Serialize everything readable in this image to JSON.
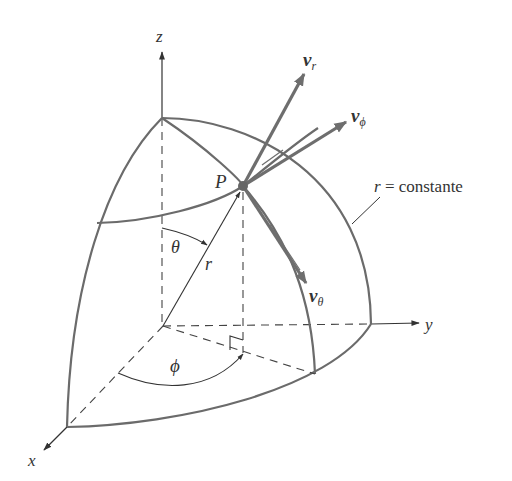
{
  "figure": {
    "colors": {
      "surface": "#6b6b6b",
      "vector": "#6e6e6e",
      "axis": "#333333",
      "text": "#333333",
      "background": "#ffffff"
    },
    "labels": {
      "z_axis": "z",
      "y_axis": "y",
      "x_axis": "x",
      "point": "P",
      "radius": "r",
      "theta": "θ",
      "phi": "ϕ",
      "v_r_main": "v",
      "v_r_sub": "r",
      "v_phi_main": "v",
      "v_phi_sub": "ϕ",
      "v_theta_main": "v",
      "v_theta_sub": "θ",
      "surface_var": "r",
      "surface_text": " = constante"
    }
  }
}
